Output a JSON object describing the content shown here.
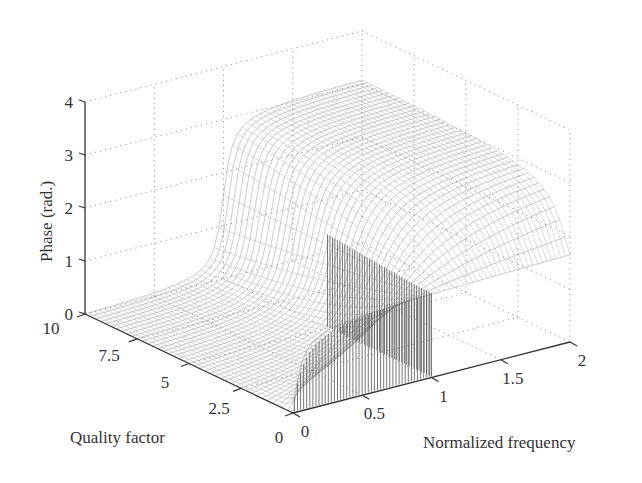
{
  "chart_data": {
    "type": "surface3d",
    "title": "",
    "xlabel": "Normalized frequency",
    "ylabel": "Quality factor",
    "zlabel": "Phase (rad.)",
    "xlim": [
      0,
      2
    ],
    "ylim": [
      0,
      10
    ],
    "zlim": [
      0,
      4
    ],
    "xticks": [
      "0",
      "0.5",
      "1",
      "1.5",
      "2"
    ],
    "yticks": [
      "0",
      "2.5",
      "5",
      "7.5",
      "10"
    ],
    "zticks": [
      "0",
      "1",
      "2",
      "3",
      "4"
    ],
    "grid": true,
    "function": "phase = atan2(f/Q, 1 - f^2)",
    "sample_points": [
      {
        "f": 0,
        "Q": 10,
        "phase": 0.0
      },
      {
        "f": 1,
        "Q": 10,
        "phase": 1.57
      },
      {
        "f": 2,
        "Q": 10,
        "phase": 3.12
      },
      {
        "f": 1,
        "Q": 0.1,
        "phase": 1.57
      },
      {
        "f": 1.05,
        "Q": 0.1,
        "phase": 3.0
      },
      {
        "f": 2,
        "Q": 0.5,
        "phase": 2.9
      }
    ]
  },
  "axes": {
    "z_label": "Phase (rad.)",
    "y_label": "Quality factor",
    "x_label": "Normalized frequency"
  }
}
